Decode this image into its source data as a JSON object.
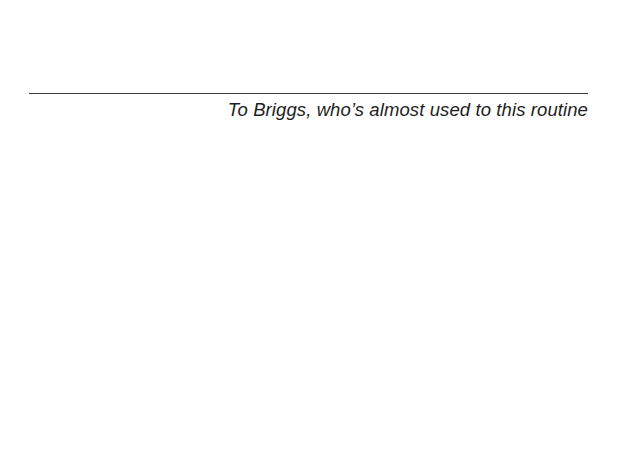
{
  "page": {
    "dedication": "To Briggs, who’s almost used to this routine"
  }
}
